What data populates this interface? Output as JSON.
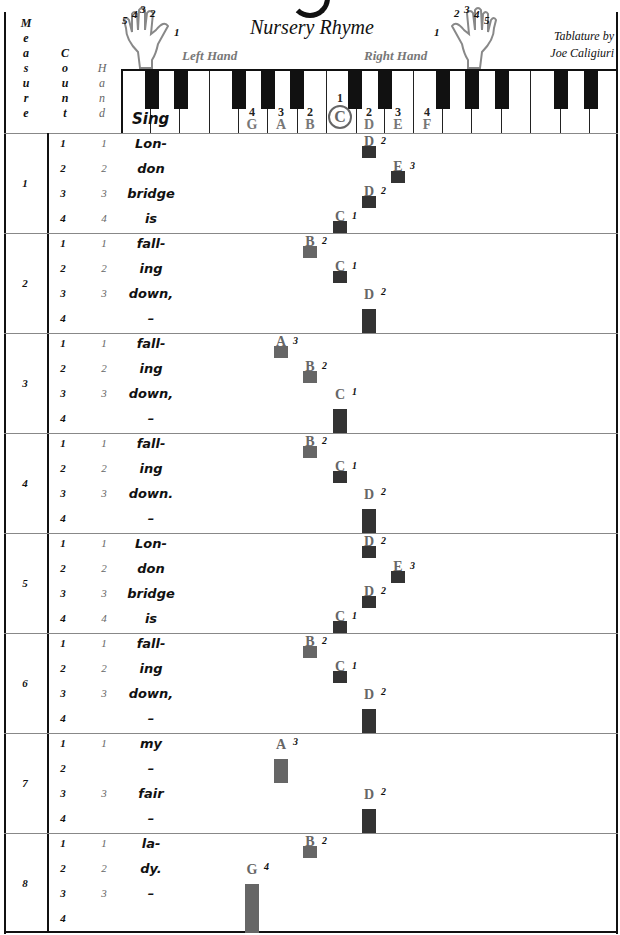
{
  "header": {
    "title": "Nursery Rhyme",
    "left_hand_label": "Left Hand",
    "right_hand_label": "Right Hand",
    "credit_line1": "Tablature by",
    "credit_line2": "Joe Caligiuri",
    "col_measure": [
      "M",
      "e",
      "a",
      "s",
      "u",
      "r",
      "e"
    ],
    "col_count": [
      "C",
      "o",
      "u",
      "n",
      "t"
    ],
    "col_hand": [
      "H",
      "a",
      "n",
      "d"
    ],
    "sing_label": "Sing",
    "left_hand_fingers": [
      "5",
      "4",
      "3",
      "2",
      "1"
    ],
    "right_hand_fingers": [
      "1",
      "2",
      "3",
      "4",
      "5"
    ]
  },
  "keyboard": {
    "labels": [
      {
        "finger": "4",
        "note": "G"
      },
      {
        "finger": "3",
        "note": "A"
      },
      {
        "finger": "2",
        "note": "B"
      },
      {
        "finger": "1",
        "note": "C",
        "circled": true
      },
      {
        "finger": "2",
        "note": "D"
      },
      {
        "finger": "3",
        "note": "E"
      },
      {
        "finger": "4",
        "note": "F"
      }
    ]
  },
  "colors": {
    "lh_note": "#666666",
    "rh_note": "#333333",
    "note_text": "#666666"
  },
  "measures": [
    {
      "number": "1",
      "beats": [
        {
          "count": "1",
          "hand": "1",
          "lyric": "Lon-"
        },
        {
          "count": "2",
          "hand": "2",
          "lyric": "don"
        },
        {
          "count": "3",
          "hand": "3",
          "lyric": "bridge"
        },
        {
          "count": "4",
          "hand": "4",
          "lyric": "is"
        }
      ],
      "notes": [
        {
          "name": "D",
          "finger": "2",
          "beat": 0,
          "len": 1
        },
        {
          "name": "E",
          "finger": "3",
          "beat": 1,
          "len": 1
        },
        {
          "name": "D",
          "finger": "2",
          "beat": 2,
          "len": 1
        },
        {
          "name": "C",
          "finger": "1",
          "beat": 3,
          "len": 1
        }
      ]
    },
    {
      "number": "2",
      "beats": [
        {
          "count": "1",
          "hand": "1",
          "lyric": "fall-"
        },
        {
          "count": "2",
          "hand": "2",
          "lyric": "ing"
        },
        {
          "count": "3",
          "hand": "3",
          "lyric": "down,"
        },
        {
          "count": "4",
          "hand": "",
          "lyric": "–"
        }
      ],
      "notes": [
        {
          "name": "B",
          "finger": "2",
          "beat": 0,
          "len": 1
        },
        {
          "name": "C",
          "finger": "1",
          "beat": 1,
          "len": 1
        },
        {
          "name": "D",
          "finger": "2",
          "beat": 2,
          "len": 2
        }
      ]
    },
    {
      "number": "3",
      "beats": [
        {
          "count": "1",
          "hand": "1",
          "lyric": "fall-"
        },
        {
          "count": "2",
          "hand": "2",
          "lyric": "ing"
        },
        {
          "count": "3",
          "hand": "3",
          "lyric": "down,"
        },
        {
          "count": "4",
          "hand": "",
          "lyric": "–"
        }
      ],
      "notes": [
        {
          "name": "A",
          "finger": "3",
          "beat": 0,
          "len": 1
        },
        {
          "name": "B",
          "finger": "2",
          "beat": 1,
          "len": 1
        },
        {
          "name": "C",
          "finger": "1",
          "beat": 2,
          "len": 2
        }
      ]
    },
    {
      "number": "4",
      "beats": [
        {
          "count": "1",
          "hand": "1",
          "lyric": "fall-"
        },
        {
          "count": "2",
          "hand": "2",
          "lyric": "ing"
        },
        {
          "count": "3",
          "hand": "3",
          "lyric": "down."
        },
        {
          "count": "4",
          "hand": "",
          "lyric": "–"
        }
      ],
      "notes": [
        {
          "name": "B",
          "finger": "2",
          "beat": 0,
          "len": 1
        },
        {
          "name": "C",
          "finger": "1",
          "beat": 1,
          "len": 1
        },
        {
          "name": "D",
          "finger": "2",
          "beat": 2,
          "len": 2
        }
      ]
    },
    {
      "number": "5",
      "beats": [
        {
          "count": "1",
          "hand": "1",
          "lyric": "Lon-"
        },
        {
          "count": "2",
          "hand": "2",
          "lyric": "don"
        },
        {
          "count": "3",
          "hand": "3",
          "lyric": "bridge"
        },
        {
          "count": "4",
          "hand": "4",
          "lyric": "is"
        }
      ],
      "notes": [
        {
          "name": "D",
          "finger": "2",
          "beat": 0,
          "len": 1
        },
        {
          "name": "E",
          "finger": "3",
          "beat": 1,
          "len": 1
        },
        {
          "name": "D",
          "finger": "2",
          "beat": 2,
          "len": 1
        },
        {
          "name": "C",
          "finger": "1",
          "beat": 3,
          "len": 1
        }
      ]
    },
    {
      "number": "6",
      "beats": [
        {
          "count": "1",
          "hand": "1",
          "lyric": "fall-"
        },
        {
          "count": "2",
          "hand": "2",
          "lyric": "ing"
        },
        {
          "count": "3",
          "hand": "3",
          "lyric": "down,"
        },
        {
          "count": "4",
          "hand": "",
          "lyric": "–"
        }
      ],
      "notes": [
        {
          "name": "B",
          "finger": "2",
          "beat": 0,
          "len": 1
        },
        {
          "name": "C",
          "finger": "1",
          "beat": 1,
          "len": 1
        },
        {
          "name": "D",
          "finger": "2",
          "beat": 2,
          "len": 2
        }
      ]
    },
    {
      "number": "7",
      "beats": [
        {
          "count": "1",
          "hand": "1",
          "lyric": "my"
        },
        {
          "count": "2",
          "hand": "",
          "lyric": "–"
        },
        {
          "count": "3",
          "hand": "3",
          "lyric": "fair"
        },
        {
          "count": "4",
          "hand": "",
          "lyric": "–"
        }
      ],
      "notes": [
        {
          "name": "A",
          "finger": "3",
          "beat": 0,
          "len": 2
        },
        {
          "name": "D",
          "finger": "2",
          "beat": 2,
          "len": 2
        }
      ]
    },
    {
      "number": "8",
      "beats": [
        {
          "count": "1",
          "hand": "1",
          "lyric": "la-"
        },
        {
          "count": "2",
          "hand": "2",
          "lyric": "dy."
        },
        {
          "count": "3",
          "hand": "3",
          "lyric": "–"
        },
        {
          "count": "4",
          "hand": "",
          "lyric": ""
        }
      ],
      "notes": [
        {
          "name": "B",
          "finger": "2",
          "beat": 0,
          "len": 1
        },
        {
          "name": "G",
          "finger": "4",
          "beat": 1,
          "len": 3
        }
      ]
    }
  ]
}
